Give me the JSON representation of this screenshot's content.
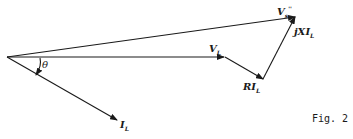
{
  "figure": {
    "caption": "Fig. 2",
    "ink_color": "#1a1a1a",
    "background": "#ffffff"
  },
  "phasors": [
    {
      "id": "Vs",
      "label_main": "V",
      "label_sub": "s",
      "label_sup": "''",
      "from": [
        7,
        57
      ],
      "to": [
        295,
        17
      ]
    },
    {
      "id": "VL",
      "label_main": "V",
      "label_sub": "L",
      "from": [
        7,
        57
      ],
      "to": [
        224,
        57
      ]
    },
    {
      "id": "RIL",
      "label_main": "RI",
      "label_sub": "L",
      "from": [
        224,
        57
      ],
      "to": [
        263,
        79
      ]
    },
    {
      "id": "jXIL",
      "label_main": "jXI",
      "label_sub": "L",
      "from": [
        263,
        79
      ],
      "to": [
        295,
        17
      ]
    },
    {
      "id": "IL",
      "label_main": "I",
      "label_sub": "L",
      "from": [
        7,
        57
      ],
      "to": [
        117,
        120
      ]
    }
  ],
  "angle": {
    "label": "θ",
    "between": [
      "VL",
      "IL"
    ]
  }
}
